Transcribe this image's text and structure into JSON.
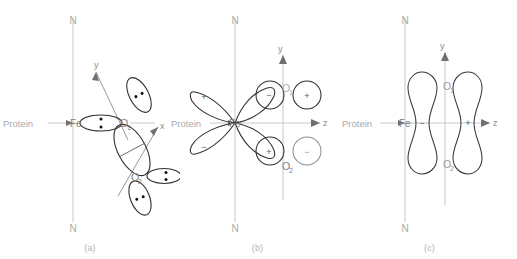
{
  "figure": {
    "type": "chemical-orbital-diagram",
    "background": "#ffffff",
    "colors": {
      "axis_gray": "#c8c8c8",
      "label_gray": "#a9a9a9",
      "atom_gray": "#9a9a9a",
      "orbital_outline": "#3a3a3a",
      "dot": "#111111",
      "caption": "#b4b4b4"
    }
  },
  "panels": [
    {
      "id": "a",
      "caption": "(a)",
      "axis_labels": {
        "top": "N",
        "bottom": "N",
        "y": "y",
        "x": "x"
      },
      "atoms": [
        {
          "label": "Fe",
          "sub": ""
        },
        {
          "label": "O",
          "sub": "1"
        },
        {
          "label": "O",
          "sub": "2"
        }
      ],
      "protein_label": "Protein",
      "lone_pairs": 5,
      "bond_style": "bent end-on Fe-O1-O2 with lone-pair ellipses"
    },
    {
      "id": "b",
      "caption": "(b)",
      "axis_labels": {
        "top": "N",
        "bottom": "N",
        "y": "y",
        "z": "z"
      },
      "atoms": [
        {
          "label": "Fe",
          "sub": ""
        },
        {
          "label": "O",
          "sub": "1"
        },
        {
          "label": "O",
          "sub": "2"
        }
      ],
      "protein_label": "Protein",
      "lobes": [
        {
          "position": "upper-left",
          "sign": "+"
        },
        {
          "position": "lower-left",
          "sign": "−"
        },
        {
          "position": "upper-right",
          "sign": "−"
        },
        {
          "position": "lower-right",
          "sign": "+"
        }
      ],
      "oxygen_p_orbitals": [
        {
          "atom": "O1",
          "sign": "+"
        },
        {
          "atom": "O2",
          "sign": "−"
        }
      ]
    },
    {
      "id": "c",
      "caption": "(c)",
      "axis_labels": {
        "top": "N",
        "bottom": "N",
        "y": "y",
        "z": "z"
      },
      "atoms": [
        {
          "label": "Fe",
          "sub": ""
        },
        {
          "label": "O",
          "sub": "1"
        },
        {
          "label": "O",
          "sub": "2"
        }
      ],
      "protein_label": "Protein",
      "lobes": [
        {
          "position": "left",
          "sign": "−"
        },
        {
          "position": "right",
          "sign": "+"
        }
      ],
      "orbital_type": "pi-antibonding dumbbell pair"
    }
  ],
  "glyphs": {
    "plus": "+",
    "minus": "−"
  }
}
